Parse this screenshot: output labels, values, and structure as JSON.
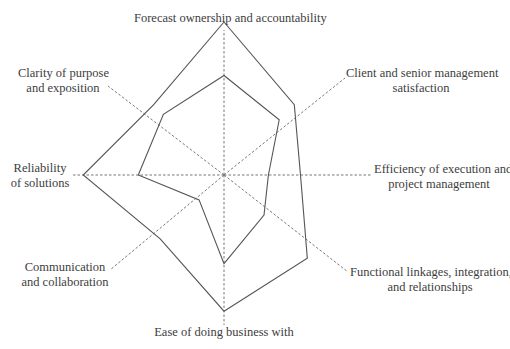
{
  "chart_data": {
    "type": "radar",
    "title": "",
    "scale": {
      "min": 0,
      "max": 10,
      "grid": false,
      "axis_style": "dashed"
    },
    "categories": [
      "Forecast ownership and accountability",
      "Client and senior management satisfaction",
      "Efficiency of execution and project management",
      "Functional linkages, integration, and relationships",
      "Ease of doing business with",
      "Communication and collaboration",
      "Reliability of solutions",
      "Clarity of purpose and exposition"
    ],
    "series": [
      {
        "name": "Outer profile",
        "values": [
          10,
          6.5,
          5.0,
          7.7,
          8.9,
          5.9,
          9.2,
          6.5
        ]
      },
      {
        "name": "Inner profile",
        "values": [
          6.5,
          5.1,
          2.9,
          3.7,
          5.8,
          2.3,
          5.6,
          5.6
        ]
      }
    ],
    "legend": null
  },
  "labels": {
    "forecast": "Forecast ownership and accountability",
    "client_l1": "Client and senior management",
    "client_l2": "satisfaction",
    "efficiency_l1": "Efficiency of execution and",
    "efficiency_l2": "project  management",
    "functional_l1": "Functional linkages, integration,",
    "functional_l2": "and relationships",
    "ease": "Ease of doing business with",
    "communication_l1": "Communication",
    "communication_l2": "and collaboration",
    "reliability_l1": "Reliability",
    "reliability_l2": "of solutions",
    "clarity_l1": "Clarity of purpose",
    "clarity_l2": "and exposition"
  },
  "colors": {
    "line": "#555555",
    "axis": "#777777",
    "text": "#3d3d3d"
  }
}
